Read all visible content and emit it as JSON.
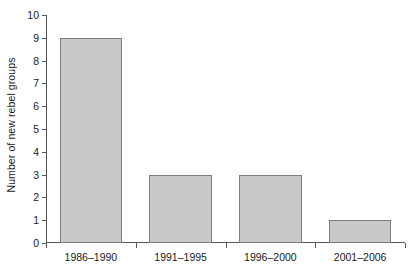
{
  "chart_data": {
    "type": "bar",
    "title": "",
    "subtitle": "",
    "xlabel": "",
    "ylabel": "Number of new rebel groups",
    "categories": [
      "1986–1990",
      "1991–1995",
      "1996–2000",
      "2001–2006"
    ],
    "values": [
      9,
      3,
      3,
      1
    ],
    "series": [
      {
        "name": "Number of new rebel groups",
        "values": [
          9,
          3,
          3,
          1
        ]
      }
    ],
    "ylim": [
      0,
      10
    ],
    "ytick_labels": [
      "0",
      "1",
      "2",
      "3",
      "4",
      "5",
      "6",
      "7",
      "8",
      "9",
      "10"
    ],
    "ytick_values": [
      0,
      1,
      2,
      3,
      4,
      5,
      6,
      7,
      8,
      9,
      10
    ],
    "grid": true,
    "grid_axis": "y",
    "legend": false,
    "legend_position": "none",
    "annotations": [],
    "colors": {
      "bar_fill": "#c9c9c9",
      "bar_stroke": "#7d7d7d",
      "gridline": "#dcdcdc",
      "axis": "#555555",
      "text": "#1a1a1a",
      "background": "#ffffff"
    }
  }
}
